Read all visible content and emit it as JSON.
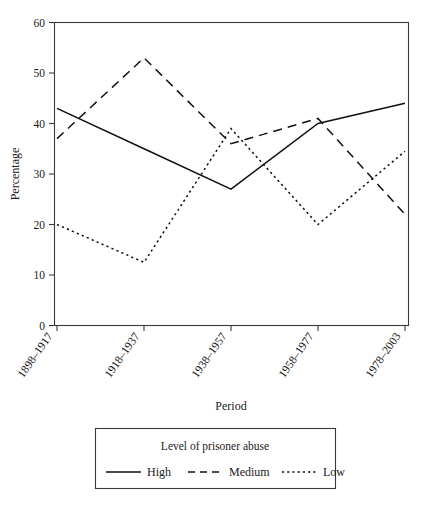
{
  "chart_data": {
    "type": "line",
    "title": "",
    "xlabel": "Period",
    "ylabel": "Percentage",
    "categories": [
      "1898–1917",
      "1918–1937",
      "1938–1957",
      "1958–1977",
      "1978–2003"
    ],
    "ylim": [
      0,
      60
    ],
    "yticks": [
      0,
      10,
      20,
      30,
      40,
      50,
      60
    ],
    "ytick_labels": [
      "0",
      "10",
      "20",
      "30",
      "40",
      "50",
      "60"
    ],
    "grid": false,
    "legend_position": "below-outside",
    "legend_title": "Level of prisoner abuse",
    "series": [
      {
        "name": "High",
        "style": "solid",
        "values": [
          43,
          35,
          27,
          40,
          44
        ]
      },
      {
        "name": "Medium",
        "style": "dashed",
        "values": [
          37,
          53,
          36,
          41,
          22
        ]
      },
      {
        "name": "Low",
        "style": "dotted",
        "values": [
          20,
          12.5,
          39,
          20,
          34.5
        ]
      }
    ],
    "colors": {
      "line": "#111111",
      "axis": "#3a3a3a",
      "background": "#ffffff"
    }
  }
}
